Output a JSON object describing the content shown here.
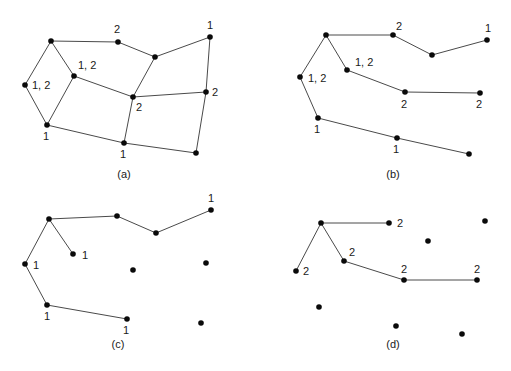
{
  "panels": [
    {
      "id": "a",
      "caption": "(a)",
      "caption_pos": [
        124,
        178
      ],
      "nodes": [
        {
          "x": 51,
          "y": 41
        },
        {
          "x": 25,
          "y": 85
        },
        {
          "x": 74,
          "y": 76
        },
        {
          "x": 47,
          "y": 125
        },
        {
          "x": 118,
          "y": 42
        },
        {
          "x": 155,
          "y": 57
        },
        {
          "x": 210,
          "y": 37
        },
        {
          "x": 133,
          "y": 97
        },
        {
          "x": 206,
          "y": 92
        },
        {
          "x": 124,
          "y": 143
        },
        {
          "x": 196,
          "y": 153
        }
      ],
      "edges": [
        [
          0,
          1
        ],
        [
          0,
          2
        ],
        [
          1,
          3
        ],
        [
          2,
          3
        ],
        [
          0,
          4
        ],
        [
          4,
          5
        ],
        [
          5,
          6
        ],
        [
          5,
          7
        ],
        [
          2,
          7
        ],
        [
          7,
          8
        ],
        [
          6,
          8
        ],
        [
          7,
          9
        ],
        [
          3,
          9
        ],
        [
          9,
          10
        ],
        [
          8,
          10
        ]
      ],
      "labels": [
        {
          "text": "1, 2",
          "x": 32,
          "y": 89
        },
        {
          "text": "1, 2",
          "x": 78,
          "y": 69
        },
        {
          "text": "2",
          "x": 114,
          "y": 33
        },
        {
          "text": "1",
          "x": 207,
          "y": 29
        },
        {
          "text": "2",
          "x": 136,
          "y": 111
        },
        {
          "text": "2",
          "x": 212,
          "y": 96
        },
        {
          "text": "1",
          "x": 43,
          "y": 140
        },
        {
          "text": "1",
          "x": 120,
          "y": 158
        }
      ]
    },
    {
      "id": "b",
      "caption": "(b)",
      "caption_pos": [
        393,
        178
      ],
      "nodes": [
        {
          "x": 326,
          "y": 35
        },
        {
          "x": 300,
          "y": 77
        },
        {
          "x": 347,
          "y": 70
        },
        {
          "x": 318,
          "y": 118
        },
        {
          "x": 393,
          "y": 35
        },
        {
          "x": 432,
          "y": 55
        },
        {
          "x": 487,
          "y": 40
        },
        {
          "x": 405,
          "y": 92
        },
        {
          "x": 480,
          "y": 93
        },
        {
          "x": 397,
          "y": 138
        },
        {
          "x": 469,
          "y": 154
        }
      ],
      "edges": [
        [
          0,
          1
        ],
        [
          0,
          2
        ],
        [
          1,
          3
        ],
        [
          0,
          4
        ],
        [
          4,
          5
        ],
        [
          5,
          6
        ],
        [
          2,
          7
        ],
        [
          7,
          8
        ],
        [
          3,
          9
        ],
        [
          9,
          10
        ]
      ],
      "labels": [
        {
          "text": "1, 2",
          "x": 308,
          "y": 82
        },
        {
          "text": "1, 2",
          "x": 355,
          "y": 66
        },
        {
          "text": "2",
          "x": 396,
          "y": 30
        },
        {
          "text": "1",
          "x": 485,
          "y": 32
        },
        {
          "text": "2",
          "x": 401,
          "y": 108
        },
        {
          "text": "2",
          "x": 476,
          "y": 108
        },
        {
          "text": "1",
          "x": 314,
          "y": 133
        },
        {
          "text": "1",
          "x": 393,
          "y": 153
        }
      ]
    },
    {
      "id": "c",
      "caption": "(c)",
      "caption_pos": [
        118,
        348
      ],
      "nodes": [
        {
          "x": 49,
          "y": 219
        },
        {
          "x": 25,
          "y": 264
        },
        {
          "x": 73,
          "y": 254
        },
        {
          "x": 47,
          "y": 305
        },
        {
          "x": 117,
          "y": 216
        },
        {
          "x": 156,
          "y": 233
        },
        {
          "x": 211,
          "y": 210
        },
        {
          "x": 133,
          "y": 270
        },
        {
          "x": 206,
          "y": 263
        },
        {
          "x": 127,
          "y": 319
        },
        {
          "x": 201,
          "y": 323
        }
      ],
      "edges": [
        [
          0,
          1
        ],
        [
          0,
          2
        ],
        [
          1,
          3
        ],
        [
          0,
          4
        ],
        [
          4,
          5
        ],
        [
          5,
          6
        ],
        [
          3,
          9
        ]
      ],
      "labels": [
        {
          "text": "1",
          "x": 33,
          "y": 269
        },
        {
          "text": "1",
          "x": 82,
          "y": 259
        },
        {
          "text": "1",
          "x": 208,
          "y": 202
        },
        {
          "text": "1",
          "x": 44,
          "y": 320
        },
        {
          "text": "1",
          "x": 123,
          "y": 334
        }
      ]
    },
    {
      "id": "d",
      "caption": "(d)",
      "caption_pos": [
        393,
        348
      ],
      "nodes": [
        {
          "x": 321,
          "y": 223
        },
        {
          "x": 296,
          "y": 271
        },
        {
          "x": 344,
          "y": 261
        },
        {
          "x": 319,
          "y": 307
        },
        {
          "x": 389,
          "y": 223
        },
        {
          "x": 428,
          "y": 241
        },
        {
          "x": 485,
          "y": 221
        },
        {
          "x": 404,
          "y": 280
        },
        {
          "x": 477,
          "y": 280
        },
        {
          "x": 396,
          "y": 326
        },
        {
          "x": 462,
          "y": 334
        }
      ],
      "edges": [
        [
          0,
          1
        ],
        [
          0,
          2
        ],
        [
          0,
          4
        ],
        [
          2,
          7
        ],
        [
          7,
          8
        ]
      ],
      "labels": [
        {
          "text": "2",
          "x": 303,
          "y": 275
        },
        {
          "text": "2",
          "x": 349,
          "y": 256
        },
        {
          "text": "2",
          "x": 397,
          "y": 227
        },
        {
          "text": "2",
          "x": 401,
          "y": 273
        },
        {
          "text": "2",
          "x": 474,
          "y": 273
        }
      ]
    }
  ]
}
